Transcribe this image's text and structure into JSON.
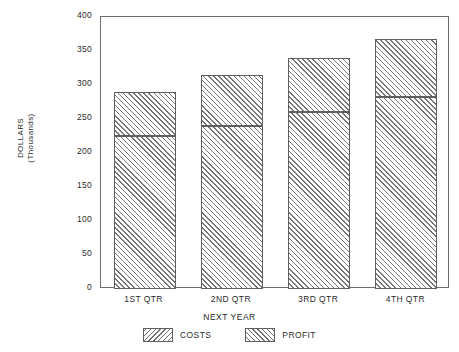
{
  "chart_data": {
    "type": "bar",
    "title": "",
    "subtitle": "",
    "stacked": true,
    "categories": [
      "1ST QTR",
      "2ND QTR",
      "3RD QTR",
      "4TH QTR"
    ],
    "series": [
      {
        "name": "COSTS",
        "values": [
          225,
          240,
          260,
          282
        ]
      },
      {
        "name": "PROFIT",
        "values": [
          65,
          75,
          80,
          86
        ]
      }
    ],
    "totals": [
      290,
      315,
      340,
      368
    ],
    "xlabel": "NEXT YEAR",
    "ylabel": "DOLLARS",
    "ylabel_line2": "(Thousands)",
    "ylim": [
      0,
      400
    ],
    "yticks": [
      0,
      50,
      100,
      150,
      200,
      250,
      300,
      350,
      400
    ],
    "ytick_labels": [
      "0",
      "50",
      "100",
      "150",
      "200",
      "250",
      "300",
      "350",
      "400"
    ],
    "grid": false,
    "legend_position": "bottom-center",
    "legend": [
      {
        "label": "COSTS",
        "pattern": "backslash-hatch"
      },
      {
        "label": "PROFIT",
        "pattern": "forwardslash-hatch"
      }
    ],
    "colors": {
      "frame": "#6e6e6e",
      "bar_outline": "#5f5f5f",
      "hatch": "#777777",
      "background": "#ffffff",
      "text": "#2b2b2b"
    }
  }
}
